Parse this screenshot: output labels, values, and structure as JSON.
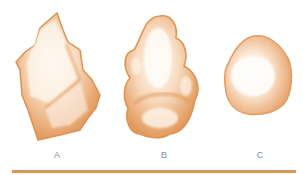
{
  "diagram": {
    "title": "",
    "colors": {
      "grain_fill": "#e9a56e",
      "grain_edge": "#d98c4f",
      "highlight": "#fffaf4",
      "label": "#8a8a8a",
      "baseline": "#d9955a"
    },
    "grains": [
      {
        "id": "A",
        "label": "A",
        "shape": "angular"
      },
      {
        "id": "B",
        "label": "B",
        "shape": "subrounded-lobate"
      },
      {
        "id": "C",
        "label": "C",
        "shape": "rounded"
      }
    ]
  }
}
